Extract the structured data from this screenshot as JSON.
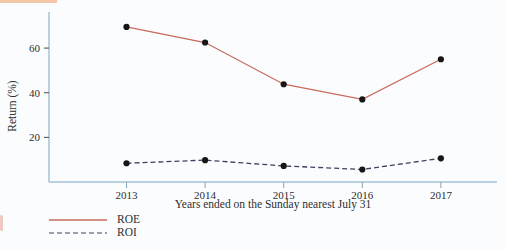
{
  "page": {
    "background": "#fbfcfd",
    "text_color": "#2f2f2f"
  },
  "decor": {
    "top_bar_color": "#f2c6a6",
    "edge_smudge_color": "#e08a76"
  },
  "chart_data": {
    "type": "line",
    "title": "",
    "xlabel": "Years ended on the Sunday nearest July 31",
    "ylabel": "Return (%)",
    "categories": [
      "2013",
      "2014",
      "2015",
      "2016",
      "2017"
    ],
    "series": [
      {
        "name": "ROE",
        "style": "solid",
        "color": "#cb6a5c",
        "values": [
          69.5,
          62.5,
          43.8,
          37.0,
          55.0
        ]
      },
      {
        "name": "ROI",
        "style": "dashed",
        "color": "#3e4160",
        "values": [
          8.4,
          9.8,
          7.2,
          5.6,
          10.6
        ]
      }
    ],
    "yticks": [
      20,
      40,
      60
    ],
    "ylim": [
      0,
      76
    ],
    "grid": false,
    "legend_position": "bottom-left",
    "marker": "circle",
    "marker_color": "#161616",
    "axis_color": "#a5c3d5",
    "x_tick_color": "#84a7bc",
    "y_tick_color": "#4a4a4a"
  }
}
